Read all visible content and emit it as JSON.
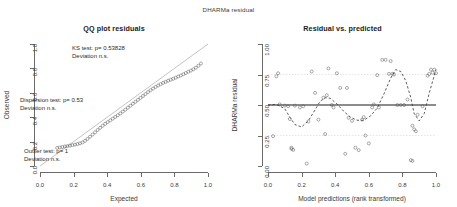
{
  "overall": {
    "title": "DHARMa residual"
  },
  "panels": {
    "qq": {
      "title": "QQ plot residuals",
      "xlabel": "Expected",
      "ylabel": "Observed",
      "xticks": [
        "0.0",
        "0.2",
        "0.4",
        "0.6",
        "0.8",
        "1.0"
      ],
      "yticks": [
        "0.0",
        "0.2",
        "0.4",
        "0.6",
        "0.8",
        "1.0"
      ],
      "annotations": [
        {
          "line1": "KS test: p= 0.53828",
          "line2": "Deviation  n.s."
        },
        {
          "line1": "Dispersion test: p= 0.53",
          "line2": "Deviation  n.s."
        },
        {
          "line1": "Outlier test: p= 1",
          "line2": "Deviation  n.s."
        }
      ]
    },
    "res": {
      "title": "Residual vs. predicted",
      "xlabel": "Model predictions (rank transformed)",
      "ylabel": "DHARMa residual",
      "xticks": [
        "0.0",
        "0.2",
        "0.4",
        "0.6",
        "0.8",
        "1.0"
      ],
      "yticks": [
        "0.00",
        "0.25",
        "0.50",
        "0.75",
        "1.00"
      ]
    }
  },
  "colors": {
    "axis": "#6b6b6b",
    "point": "#555555",
    "refline": "#9a9a9a",
    "quantile_line": "#333333",
    "gridline": "#c8c8c8",
    "text": "#2b2b2b"
  },
  "chart_data": [
    {
      "type": "scatter",
      "id": "qq-plot",
      "title": "QQ plot residuals",
      "xlabel": "Expected",
      "ylabel": "Observed",
      "xlim": [
        0,
        1
      ],
      "ylim": [
        0,
        1
      ],
      "grid": false,
      "reference_line": {
        "type": "identity",
        "from": [
          0,
          0
        ],
        "to": [
          1,
          1
        ]
      },
      "x": [
        0.102,
        0.118,
        0.133,
        0.148,
        0.163,
        0.178,
        0.193,
        0.208,
        0.223,
        0.238,
        0.253,
        0.268,
        0.283,
        0.298,
        0.313,
        0.328,
        0.343,
        0.358,
        0.373,
        0.388,
        0.403,
        0.418,
        0.433,
        0.448,
        0.463,
        0.478,
        0.493,
        0.508,
        0.523,
        0.538,
        0.553,
        0.568,
        0.583,
        0.598,
        0.613,
        0.628,
        0.643,
        0.658,
        0.673,
        0.688,
        0.703,
        0.718,
        0.733,
        0.748,
        0.763,
        0.778,
        0.793,
        0.808,
        0.823,
        0.838,
        0.853,
        0.868,
        0.883,
        0.898,
        0.913,
        0.928,
        0.943,
        0.958
      ],
      "y": [
        0.148,
        0.152,
        0.156,
        0.16,
        0.163,
        0.167,
        0.171,
        0.175,
        0.18,
        0.186,
        0.193,
        0.206,
        0.222,
        0.24,
        0.258,
        0.276,
        0.295,
        0.313,
        0.33,
        0.346,
        0.36,
        0.374,
        0.388,
        0.402,
        0.416,
        0.431,
        0.446,
        0.462,
        0.478,
        0.494,
        0.51,
        0.526,
        0.542,
        0.558,
        0.574,
        0.59,
        0.606,
        0.621,
        0.635,
        0.648,
        0.66,
        0.671,
        0.681,
        0.69,
        0.699,
        0.707,
        0.715,
        0.724,
        0.733,
        0.742,
        0.752,
        0.762,
        0.772,
        0.782,
        0.793,
        0.806,
        0.822,
        0.84
      ]
    },
    {
      "type": "scatter",
      "id": "residual-vs-predicted",
      "title": "Residual vs. predicted",
      "xlabel": "Model predictions (rank transformed)",
      "ylabel": "DHARMa residual",
      "xlim": [
        0,
        1
      ],
      "ylim": [
        0,
        1
      ],
      "grid": true,
      "gridlines_y": [
        0.25,
        0.75
      ],
      "reference_line": {
        "type": "horizontal",
        "y": 0.5
      },
      "x": [
        0.03,
        0.05,
        0.06,
        0.07,
        0.1,
        0.12,
        0.13,
        0.14,
        0.14,
        0.15,
        0.16,
        0.19,
        0.21,
        0.23,
        0.24,
        0.26,
        0.28,
        0.3,
        0.33,
        0.34,
        0.35,
        0.36,
        0.38,
        0.39,
        0.41,
        0.43,
        0.46,
        0.47,
        0.48,
        0.5,
        0.52,
        0.54,
        0.56,
        0.57,
        0.58,
        0.6,
        0.62,
        0.63,
        0.65,
        0.66,
        0.68,
        0.7,
        0.72,
        0.73,
        0.74,
        0.75,
        0.77,
        0.79,
        0.81,
        0.83,
        0.85,
        0.86,
        0.86,
        0.87,
        0.88,
        0.89,
        0.92,
        0.95,
        0.96,
        0.97,
        0.98,
        0.99,
        1.0
      ],
      "y": [
        0.245,
        0.735,
        0.76,
        0.505,
        0.495,
        0.49,
        0.385,
        0.15,
        0.14,
        0.132,
        0.495,
        0.48,
        0.49,
        0.02,
        0.365,
        0.775,
        0.6,
        0.38,
        0.56,
        0.262,
        0.58,
        0.8,
        0.5,
        0.48,
        0.76,
        0.64,
        0.1,
        0.64,
        0.395,
        0.37,
        0.15,
        0.13,
        0.38,
        0.4,
        0.25,
        0.185,
        0.48,
        0.505,
        0.745,
        0.48,
        0.87,
        0.87,
        0.755,
        0.86,
        0.755,
        0.75,
        0.5,
        0.5,
        0.5,
        0.545,
        0.048,
        0.042,
        0.33,
        0.3,
        0.285,
        0.42,
        0.49,
        0.74,
        0.755,
        0.79,
        0.765,
        0.79,
        0.76
      ],
      "quantile_curve": {
        "description": "smoothed dashed quantile regression line",
        "x": [
          0.0,
          0.05,
          0.1,
          0.13,
          0.16,
          0.2,
          0.24,
          0.28,
          0.31,
          0.34,
          0.37,
          0.41,
          0.45,
          0.49,
          0.53,
          0.57,
          0.61,
          0.65,
          0.69,
          0.73,
          0.76,
          0.79,
          0.82,
          0.85,
          0.87,
          0.9,
          0.93,
          0.96,
          1.0
        ],
        "y": [
          0.5,
          0.505,
          0.47,
          0.4,
          0.34,
          0.32,
          0.37,
          0.46,
          0.53,
          0.56,
          0.555,
          0.51,
          0.45,
          0.4,
          0.375,
          0.375,
          0.41,
          0.475,
          0.59,
          0.72,
          0.79,
          0.775,
          0.7,
          0.56,
          0.43,
          0.37,
          0.43,
          0.6,
          0.79
        ]
      }
    }
  ]
}
